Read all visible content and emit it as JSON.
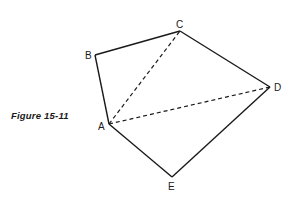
{
  "figure": {
    "caption": "Figure 15-11",
    "points": {
      "A": {
        "label": "A",
        "x": 109,
        "y": 124
      },
      "B": {
        "label": "B",
        "x": 95,
        "y": 55
      },
      "C": {
        "label": "C",
        "x": 180,
        "y": 31
      },
      "D": {
        "label": "D",
        "x": 270,
        "y": 87
      },
      "E": {
        "label": "E",
        "x": 172,
        "y": 177
      }
    },
    "solid_edges": [
      [
        "A",
        "B"
      ],
      [
        "B",
        "C"
      ],
      [
        "C",
        "D"
      ],
      [
        "D",
        "E"
      ],
      [
        "E",
        "A"
      ]
    ],
    "dashed_edges": [
      [
        "A",
        "C"
      ],
      [
        "A",
        "D"
      ]
    ],
    "line_color": "#1a1a1a"
  }
}
